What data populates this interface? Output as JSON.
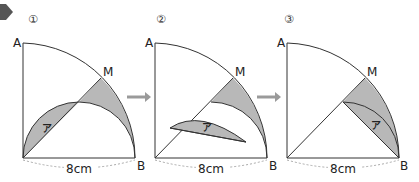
{
  "figure": {
    "colors": {
      "shade": "#b8b8b8",
      "line": "#333333",
      "arrow": "#9a9a9a",
      "dashed": "#aaaaaa",
      "marker": "#555555"
    },
    "panels": [
      {
        "step": "①",
        "labels": {
          "top": "A",
          "corner": "B",
          "right": "B",
          "arc_point": "M",
          "region": "ア"
        },
        "dimension": "8cm"
      },
      {
        "step": "②",
        "labels": {
          "top": "A",
          "corner": "B",
          "right": "B",
          "arc_point": "M",
          "region": "ア"
        },
        "dimension": "8cm"
      },
      {
        "step": "③",
        "labels": {
          "top": "A",
          "corner": "B",
          "right": "B",
          "arc_point": "M",
          "region": "ア"
        },
        "dimension": "8cm"
      }
    ],
    "arrows": [
      "→",
      "→"
    ]
  }
}
